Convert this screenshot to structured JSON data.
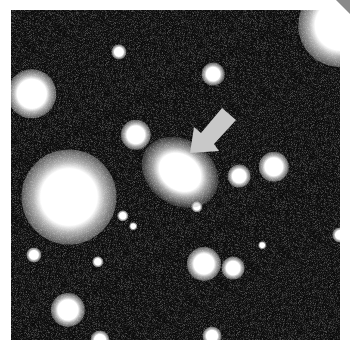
{
  "image": {
    "subject": "astronomical star field",
    "background_color": "#171717",
    "frame": {
      "x": 11,
      "y": 10,
      "width": 329,
      "height": 330
    },
    "arrow": {
      "icon": "pointer-arrow-icon",
      "color": "#c8c8c8",
      "tip": {
        "x": 190,
        "y": 153
      },
      "direction": "down-left"
    },
    "galaxy": {
      "cx": 180,
      "cy": 172,
      "rx": 24,
      "ry": 19,
      "angle": 35
    },
    "stars": [
      {
        "cx": 32,
        "cy": 94,
        "r": 13
      },
      {
        "cx": 119,
        "cy": 52,
        "r": 4
      },
      {
        "cx": 213,
        "cy": 74,
        "r": 6
      },
      {
        "cx": 136,
        "cy": 135,
        "r": 8
      },
      {
        "cx": 69,
        "cy": 197,
        "r": 25
      },
      {
        "cx": 239,
        "cy": 176,
        "r": 6
      },
      {
        "cx": 274,
        "cy": 167,
        "r": 8
      },
      {
        "cx": 197,
        "cy": 207,
        "r": 3
      },
      {
        "cx": 123,
        "cy": 216,
        "r": 3
      },
      {
        "cx": 133,
        "cy": 226,
        "r": 2
      },
      {
        "cx": 34,
        "cy": 255,
        "r": 4
      },
      {
        "cx": 98,
        "cy": 262,
        "r": 3
      },
      {
        "cx": 204,
        "cy": 264,
        "r": 9
      },
      {
        "cx": 233,
        "cy": 268,
        "r": 6
      },
      {
        "cx": 262,
        "cy": 245,
        "r": 2
      },
      {
        "cx": 68,
        "cy": 310,
        "r": 9
      },
      {
        "cx": 340,
        "cy": 25,
        "r": 22
      },
      {
        "cx": 340,
        "cy": 235,
        "r": 4
      },
      {
        "cx": 100,
        "cy": 340,
        "r": 5
      },
      {
        "cx": 212,
        "cy": 336,
        "r": 5
      }
    ]
  }
}
